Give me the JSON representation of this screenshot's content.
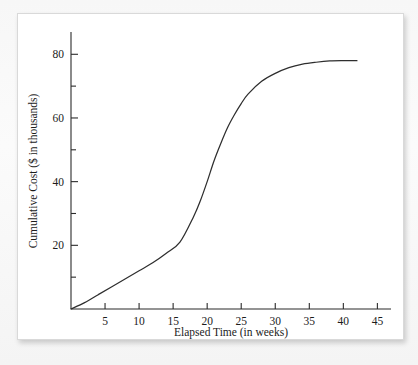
{
  "figure": {
    "panel_background": "#ffffff",
    "page_background": "#f7f7f7",
    "line_color": "#2e2e2e",
    "axis_color": "#2b2b2b",
    "partial_caption": ""
  },
  "chart_data": {
    "type": "line",
    "title": "",
    "xlabel": "Elapsed Time (in weeks)",
    "ylabel": "Cumulative Cost ($ in thousands)",
    "xlim": [
      0,
      47
    ],
    "ylim": [
      0,
      87
    ],
    "grid": false,
    "legend": false,
    "x_ticks": [
      5,
      10,
      15,
      20,
      25,
      30,
      35,
      40,
      45
    ],
    "x_tick_labels": [
      "5",
      "10",
      "15",
      "20",
      "25",
      "30",
      "35",
      "40",
      "45"
    ],
    "x_minor_ticks": [],
    "y_ticks": [
      20,
      40,
      60,
      80
    ],
    "y_tick_labels": [
      "20",
      "40",
      "60",
      "80"
    ],
    "y_minor_ticks": [
      10,
      30,
      50,
      70
    ],
    "series": [
      {
        "name": "Cumulative Cost",
        "x": [
          0,
          2,
          4,
          6,
          8,
          10,
          12,
          14,
          16,
          18,
          19,
          20,
          21,
          22,
          23,
          24,
          25,
          26,
          28,
          30,
          32,
          34,
          36,
          38,
          40,
          42
        ],
        "y": [
          0,
          2,
          4.5,
          7,
          9.5,
          12,
          14.5,
          17.5,
          21,
          29,
          34,
          40,
          46.5,
          52,
          57,
          61,
          64.5,
          67.5,
          71.5,
          74,
          75.8,
          76.9,
          77.5,
          77.9,
          78,
          78
        ]
      }
    ],
    "annotations": []
  }
}
